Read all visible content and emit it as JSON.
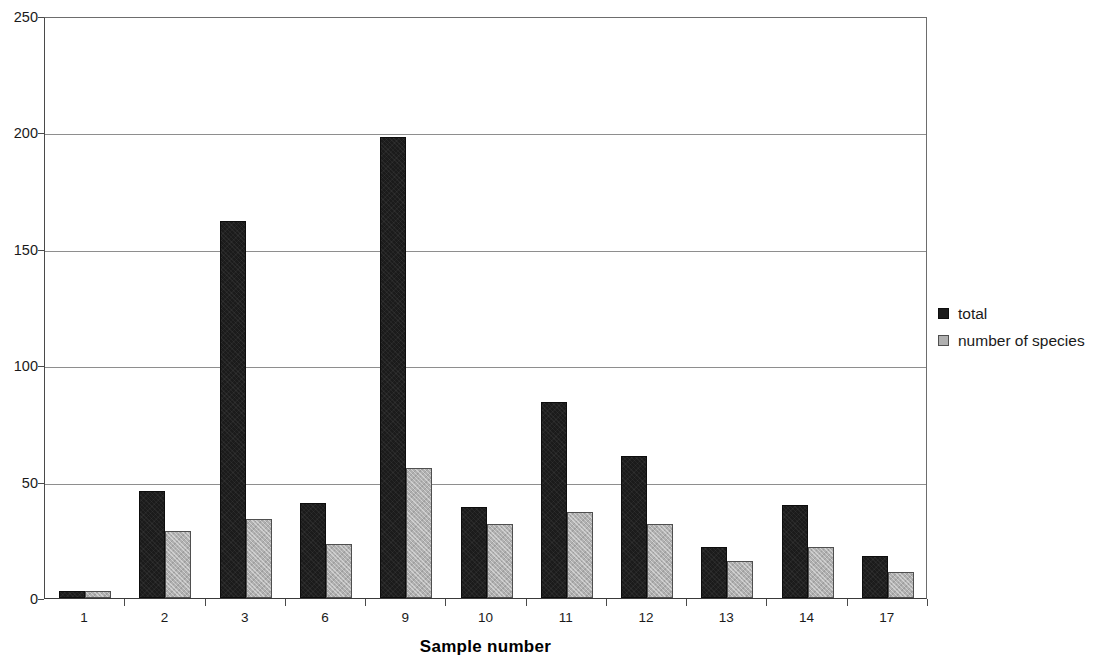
{
  "chart_data": {
    "type": "bar",
    "title": "",
    "xlabel": "Sample number",
    "ylabel": "",
    "categories": [
      "1",
      "2",
      "3",
      "6",
      "9",
      "10",
      "11",
      "12",
      "13",
      "14",
      "17"
    ],
    "series": [
      {
        "name": "total",
        "color": "#1b1b1b",
        "values": [
          3,
          46,
          162,
          41,
          198,
          39,
          84,
          61,
          22,
          40,
          18
        ]
      },
      {
        "name": "number of species",
        "color": "#b0b0b0",
        "values": [
          3,
          29,
          34,
          23,
          56,
          32,
          37,
          32,
          16,
          22,
          11
        ]
      }
    ],
    "ylim": [
      0,
      250
    ],
    "yticks": [
      0,
      50,
      100,
      150,
      200,
      250
    ],
    "ytick_labels": [
      "0",
      "50",
      "100",
      "150",
      "200",
      "250"
    ],
    "grid": "horizontal",
    "legend_position": "right"
  },
  "legend": {
    "entries": [
      {
        "label": "total"
      },
      {
        "label": "number of species"
      }
    ]
  },
  "axis": {
    "x_title": "Sample number"
  }
}
